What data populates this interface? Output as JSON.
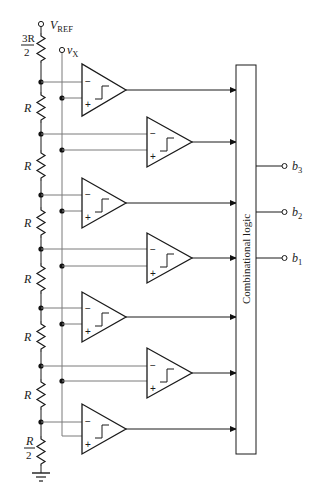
{
  "diagram": {
    "reference_input": {
      "label": "V",
      "subscript": "REF"
    },
    "analog_input": {
      "label": "v",
      "subscript": "X"
    },
    "resistor_ladder": {
      "top": {
        "num": "3R",
        "den": "2"
      },
      "middle_label": "R",
      "middle_count": 6,
      "bottom": {
        "num": "R",
        "den": "2"
      }
    },
    "comparators": [
      {
        "id": "c1",
        "minus": "−",
        "plus": "+"
      },
      {
        "id": "c2",
        "minus": "−",
        "plus": "+"
      },
      {
        "id": "c3",
        "minus": "−",
        "plus": "+"
      },
      {
        "id": "c4",
        "minus": "−",
        "plus": "+"
      },
      {
        "id": "c5",
        "minus": "−",
        "plus": "+"
      },
      {
        "id": "c6",
        "minus": "−",
        "plus": "+"
      },
      {
        "id": "c7",
        "minus": "−",
        "plus": "+"
      }
    ],
    "logic_block": {
      "label": "Combinational logic"
    },
    "outputs": [
      {
        "label": "b",
        "subscript": "3"
      },
      {
        "label": "b",
        "subscript": "2"
      },
      {
        "label": "b",
        "subscript": "1"
      }
    ],
    "ground": "ground"
  }
}
